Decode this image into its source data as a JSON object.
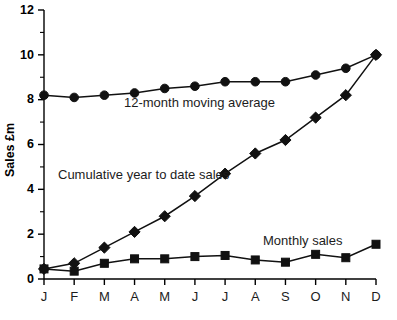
{
  "chart_data": {
    "type": "line",
    "title": "",
    "xlabel": "",
    "ylabel": "Sales £m",
    "categories": [
      "J",
      "F",
      "M",
      "A",
      "M",
      "J",
      "J",
      "A",
      "S",
      "O",
      "N",
      "D"
    ],
    "ylim": [
      0,
      12
    ],
    "yticks": [
      0,
      2,
      4,
      6,
      8,
      10,
      12
    ],
    "ytick_labels": [
      "0",
      "2",
      "4",
      "6",
      "8",
      "10",
      "12"
    ],
    "yminor_ticks": [
      1,
      3,
      5,
      7,
      9,
      11
    ],
    "grid": false,
    "legend_position": "inline-annotations",
    "series": [
      {
        "name": "12-month moving average",
        "marker": "circle",
        "values": [
          8.2,
          8.1,
          8.2,
          8.3,
          8.5,
          8.6,
          8.8,
          8.8,
          8.8,
          9.1,
          9.4,
          10.0
        ]
      },
      {
        "name": "Cumulative year to date sales",
        "marker": "diamond",
        "values": [
          0.45,
          0.7,
          1.4,
          2.1,
          2.8,
          3.7,
          4.7,
          5.6,
          6.2,
          7.2,
          8.2,
          10.0
        ]
      },
      {
        "name": "Monthly sales",
        "marker": "square",
        "values": [
          0.45,
          0.35,
          0.7,
          0.9,
          0.9,
          1.0,
          1.05,
          0.85,
          0.75,
          1.1,
          0.95,
          1.55
        ]
      }
    ],
    "annotations": [
      {
        "text": "12-month moving average",
        "x": 124,
        "y": 107
      },
      {
        "text": "Cumulative year to date sales",
        "x": 58,
        "y": 179
      },
      {
        "text": "Monthly sales",
        "x": 263,
        "y": 245
      }
    ]
  },
  "colors": {
    "series": "#111111",
    "axis": "#000000",
    "background": "#ffffff"
  }
}
